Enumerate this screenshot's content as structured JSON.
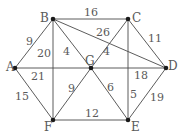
{
  "diagram": {
    "type": "weighted-undirected-graph",
    "nodes": [
      {
        "id": "A",
        "label": "A",
        "x": 15,
        "y": 68,
        "lx": 6,
        "ly": 71
      },
      {
        "id": "B",
        "label": "B",
        "x": 53,
        "y": 19,
        "lx": 40,
        "ly": 22
      },
      {
        "id": "C",
        "label": "C",
        "x": 128,
        "y": 19,
        "lx": 132,
        "ly": 22
      },
      {
        "id": "D",
        "label": "D",
        "x": 166,
        "y": 68,
        "lx": 168,
        "ly": 70
      },
      {
        "id": "G",
        "label": "G",
        "x": 91,
        "y": 68,
        "lx": 85,
        "ly": 65
      },
      {
        "id": "F",
        "label": "F",
        "x": 53,
        "y": 120,
        "lx": 44,
        "ly": 131
      },
      {
        "id": "E",
        "label": "E",
        "x": 128,
        "y": 120,
        "lx": 131,
        "ly": 131
      }
    ],
    "edges": [
      {
        "from": "A",
        "to": "B",
        "weight": "9",
        "lx": 26,
        "ly": 45
      },
      {
        "from": "B",
        "to": "C",
        "weight": "16",
        "lx": 84,
        "ly": 16
      },
      {
        "from": "B",
        "to": "D",
        "weight": "26",
        "lx": 96,
        "ly": 36
      },
      {
        "from": "C",
        "to": "D",
        "weight": "11",
        "lx": 148,
        "ly": 42
      },
      {
        "from": "B",
        "to": "F",
        "weight": "20",
        "lx": 37,
        "ly": 57
      },
      {
        "from": "B",
        "to": "G",
        "weight": "4",
        "lx": 63,
        "ly": 55
      },
      {
        "from": "C",
        "to": "G",
        "weight": "4",
        "lx": 103,
        "ly": 55
      },
      {
        "from": "C",
        "to": "E",
        "weight": "5",
        "lx": 130,
        "ly": 98
      },
      {
        "from": "A",
        "to": "G",
        "weight": "21",
        "lx": 31,
        "ly": 80
      },
      {
        "from": "G",
        "to": "D",
        "weight": "18",
        "lx": 134,
        "ly": 79
      },
      {
        "from": "A",
        "to": "F",
        "weight": "15",
        "lx": 15,
        "ly": 100
      },
      {
        "from": "F",
        "to": "G",
        "weight": "9",
        "lx": 68,
        "ly": 92
      },
      {
        "from": "G",
        "to": "E",
        "weight": "6",
        "lx": 107,
        "ly": 91
      },
      {
        "from": "F",
        "to": "E",
        "weight": "12",
        "lx": 85,
        "ly": 117
      },
      {
        "from": "D",
        "to": "E",
        "weight": "19",
        "lx": 150,
        "ly": 101
      }
    ]
  }
}
